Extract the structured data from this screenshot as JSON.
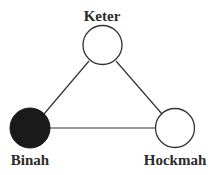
{
  "diagram": {
    "title": "",
    "colors": {
      "stroke": "#333333",
      "filled": "#1a1a1a",
      "empty": "#ffffff",
      "text": "#2a2a2a"
    },
    "nodes": [
      {
        "id": "keter",
        "label": "Keter",
        "cx": 102.5,
        "cy": 45,
        "r": 19.5,
        "filled": false
      },
      {
        "id": "binah",
        "label": "Binah",
        "cx": 30,
        "cy": 128,
        "r": 20,
        "filled": true
      },
      {
        "id": "hockmah",
        "label": "Hockmah",
        "cx": 175,
        "cy": 128,
        "r": 19.5,
        "filled": false
      }
    ],
    "edges": [
      {
        "from": "keter",
        "to": "binah"
      },
      {
        "from": "keter",
        "to": "hockmah"
      },
      {
        "from": "binah",
        "to": "hockmah"
      }
    ]
  }
}
